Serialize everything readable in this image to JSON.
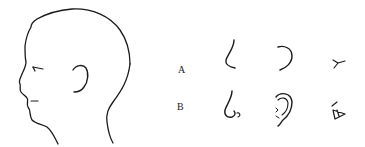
{
  "figure": {
    "stroke_color": "#1a1a1a",
    "background": "#ffffff"
  },
  "head": {
    "label": "head-profile"
  },
  "rows": [
    {
      "label": "A",
      "style": "simplified",
      "features": [
        "nose",
        "ear",
        "eye"
      ]
    },
    {
      "label": "B",
      "style": "detailed",
      "features": [
        "nose",
        "ear",
        "eye"
      ]
    }
  ]
}
